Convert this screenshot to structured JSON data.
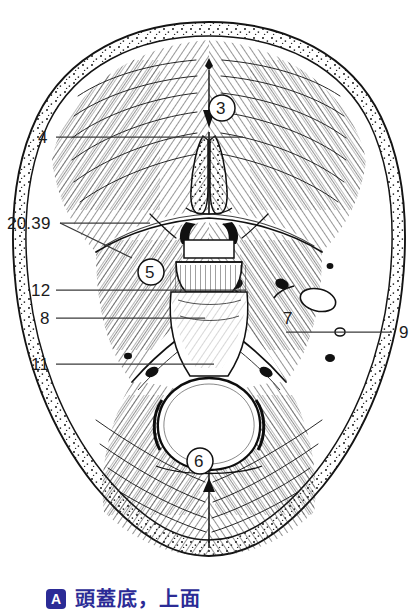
{
  "figure": {
    "title": "頭蓋底，上面",
    "panel_letter": "A",
    "caption_color": "#2b2b96",
    "view": "skull-base-superior-view",
    "ink_color": "#1b1b1b",
    "background": "#ffffff"
  },
  "leader_labels": [
    {
      "id": "label-4",
      "text": "4",
      "x": 38,
      "y": 131
    },
    {
      "id": "label-20-39",
      "text": "20.39",
      "x": 8,
      "y": 217
    },
    {
      "id": "label-12",
      "text": "12",
      "x": 32,
      "y": 284
    },
    {
      "id": "label-8",
      "text": "8",
      "x": 40,
      "y": 312
    },
    {
      "id": "label-11",
      "text": "11",
      "x": 32,
      "y": 358
    },
    {
      "id": "label-9",
      "text": "9",
      "x": 399,
      "y": 326
    }
  ],
  "circled_callouts": [
    {
      "id": "callout-3",
      "text": "3",
      "cx": 222,
      "cy": 108,
      "r": 13
    },
    {
      "id": "callout-5",
      "text": "5",
      "cx": 151,
      "cy": 272,
      "r": 13
    },
    {
      "id": "callout-6",
      "text": "6",
      "cx": 200,
      "cy": 461,
      "r": 13
    }
  ],
  "plain_callouts": [
    {
      "id": "callout-7",
      "text": "7",
      "x": 288,
      "y": 318
    }
  ]
}
